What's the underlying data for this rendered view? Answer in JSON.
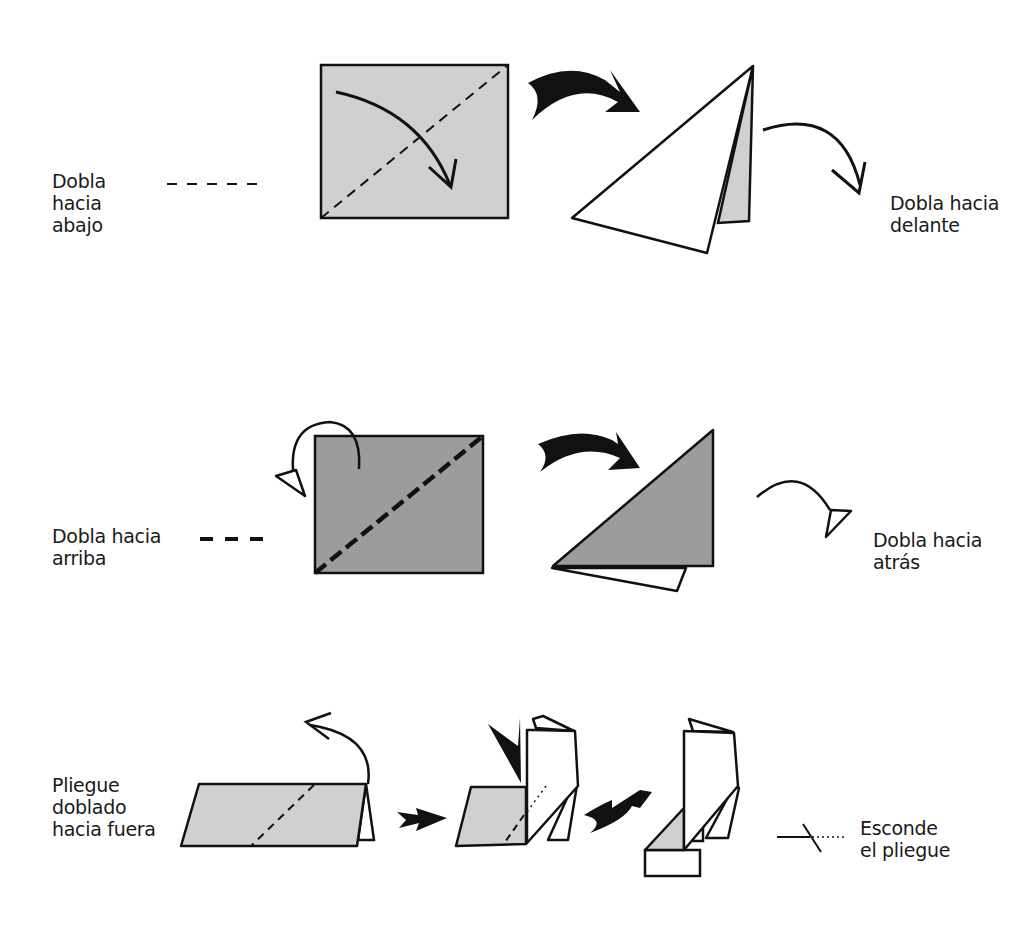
{
  "legend": {
    "valley_fold": {
      "label": "Dobla\nhacia\nabajo",
      "line_style": "thin dashed"
    },
    "mountain_fold_forward": {
      "label": "Dobla hacia\ndelante"
    },
    "mountain_fold": {
      "label": "Dobla hacia\narriba",
      "line_style": "thick dashed"
    },
    "fold_behind": {
      "label": "Dobla hacia\natrás"
    },
    "inside_reverse_fold": {
      "label": "Pliegue\ndoblado\nhacia fuera"
    },
    "hidden_fold": {
      "label": "Esconde\nel pliegue"
    }
  },
  "colors": {
    "paper_light": "#d0d0d0",
    "paper_dark": "#9c9c9c",
    "paper_white": "#ffffff",
    "ink": "#111111"
  }
}
